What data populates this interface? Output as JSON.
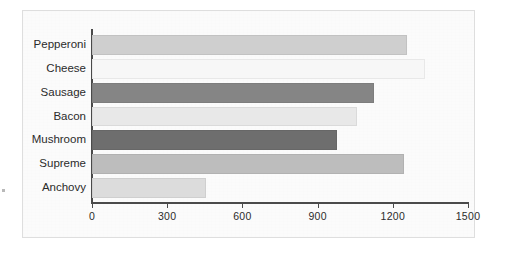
{
  "chart_data": {
    "type": "bar",
    "orientation": "horizontal",
    "title": "",
    "xlabel": "",
    "ylabel": "",
    "categories": [
      "Pepperoni",
      "Cheese",
      "Sausage",
      "Bacon",
      "Mushroom",
      "Supreme",
      "Anchovy"
    ],
    "values": [
      1256,
      1328,
      1125,
      1057,
      977,
      1244,
      455
    ],
    "bar_colors": [
      "#cfcfcf",
      "#f7f7f7",
      "#858585",
      "#e8e8e8",
      "#6e6e6e",
      "#bdbdbd",
      "#dcdcdc"
    ],
    "xlim": [
      0,
      1500
    ],
    "xticks": [
      0,
      300,
      600,
      900,
      1200,
      1500
    ],
    "xtick_labels": [
      "0",
      "300",
      "600",
      "900",
      "1200",
      "1500"
    ],
    "grid": false,
    "legend": "none",
    "series": [
      {
        "name": "Pizza orders",
        "points": [
          {
            "category": "Pepperoni",
            "value": 1256,
            "color": "#cfcfcf"
          },
          {
            "category": "Cheese",
            "value": 1328,
            "color": "#f7f7f7"
          },
          {
            "category": "Sausage",
            "value": 1125,
            "color": "#858585"
          },
          {
            "category": "Bacon",
            "value": 1057,
            "color": "#e8e8e8"
          },
          {
            "category": "Mushroom",
            "value": 977,
            "color": "#6e6e6e"
          },
          {
            "category": "Supreme",
            "value": 1244,
            "color": "#bdbdbd"
          },
          {
            "category": "Anchovy",
            "value": 455,
            "color": "#dcdcdc"
          }
        ]
      }
    ]
  },
  "style": {
    "axis_color": "#4a4a4a",
    "text_color": "#2b2b2b",
    "frame_background": "#fbfbfb",
    "frame_border": "#dedede",
    "page_background": "#ffffff"
  }
}
